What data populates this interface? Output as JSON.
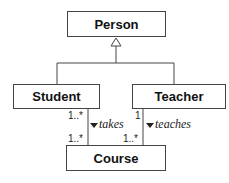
{
  "diagram": {
    "type": "UML class diagram",
    "classes": {
      "person": "Person",
      "student": "Student",
      "teacher": "Teacher",
      "course": "Course"
    },
    "generalization": {
      "parent": "Person",
      "children": [
        "Student",
        "Teacher"
      ]
    },
    "associations": [
      {
        "from": "Student",
        "to": "Course",
        "label": "takes",
        "from_mult": "1..*",
        "to_mult": "1..*"
      },
      {
        "from": "Teacher",
        "to": "Course",
        "label": "teaches",
        "from_mult": "1",
        "to_mult": "1..*"
      }
    ]
  }
}
